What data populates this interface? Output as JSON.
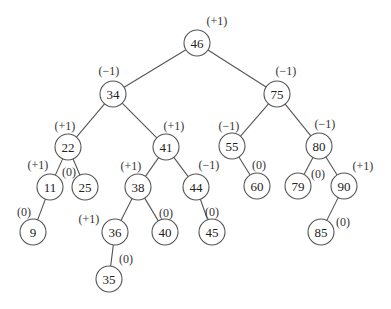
{
  "diagram": {
    "type": "AVL tree with balance factors",
    "node_radius": 13,
    "nodes": [
      {
        "id": "n46",
        "value": "46",
        "balance": "(+1)",
        "x": 197,
        "y": 43,
        "bx": 217,
        "by": 21
      },
      {
        "id": "n34",
        "value": "34",
        "balance": "(−1)",
        "x": 113,
        "y": 94,
        "bx": 109,
        "by": 71
      },
      {
        "id": "n75",
        "value": "75",
        "balance": "(−1)",
        "x": 277,
        "y": 94,
        "bx": 286,
        "by": 71
      },
      {
        "id": "n22",
        "value": "22",
        "balance": "(+1)",
        "x": 68,
        "y": 147,
        "bx": 65,
        "by": 126
      },
      {
        "id": "n41",
        "value": "41",
        "balance": "(+1)",
        "x": 166,
        "y": 147,
        "bx": 174,
        "by": 126
      },
      {
        "id": "n55",
        "value": "55",
        "balance": "(−1)",
        "x": 232,
        "y": 146,
        "bx": 229,
        "by": 126
      },
      {
        "id": "n80",
        "value": "80",
        "balance": "(−1)",
        "x": 319,
        "y": 146,
        "bx": 325,
        "by": 124
      },
      {
        "id": "n11",
        "value": "11",
        "balance": "(+1)",
        "x": 50,
        "y": 187,
        "bx": 38,
        "by": 165
      },
      {
        "id": "n25",
        "value": "25",
        "balance": "(0)",
        "x": 85,
        "y": 187,
        "bx": 69,
        "by": 172
      },
      {
        "id": "n38",
        "value": "38",
        "balance": "(+1)",
        "x": 138,
        "y": 187,
        "bx": 131,
        "by": 166
      },
      {
        "id": "n44",
        "value": "44",
        "balance": "(−1)",
        "x": 196,
        "y": 187,
        "bx": 209,
        "by": 165
      },
      {
        "id": "n60",
        "value": "60",
        "balance": "(0)",
        "x": 257,
        "y": 186,
        "bx": 259,
        "by": 165
      },
      {
        "id": "n79",
        "value": "79",
        "balance": "(0)",
        "x": 298,
        "y": 186,
        "bx": 318,
        "by": 174
      },
      {
        "id": "n90",
        "value": "90",
        "balance": "(+1)",
        "x": 344,
        "y": 186,
        "bx": 363,
        "by": 166
      },
      {
        "id": "n9",
        "value": "9",
        "balance": "(0)",
        "x": 33,
        "y": 232,
        "bx": 24,
        "by": 212
      },
      {
        "id": "n36",
        "value": "36",
        "balance": "(+1)",
        "x": 115,
        "y": 232,
        "bx": 89,
        "by": 219
      },
      {
        "id": "n40",
        "value": "40",
        "balance": "(0)",
        "x": 165,
        "y": 232,
        "bx": 166,
        "by": 213
      },
      {
        "id": "n45",
        "value": "45",
        "balance": "(0)",
        "x": 212,
        "y": 232,
        "bx": 212,
        "by": 212
      },
      {
        "id": "n85",
        "value": "85",
        "balance": "(0)",
        "x": 321,
        "y": 232,
        "bx": 343,
        "by": 222
      },
      {
        "id": "n35",
        "value": "35",
        "balance": "(0)",
        "x": 109,
        "y": 279,
        "bx": 126,
        "by": 259
      }
    ],
    "edges": [
      [
        "n46",
        "n34"
      ],
      [
        "n46",
        "n75"
      ],
      [
        "n34",
        "n22"
      ],
      [
        "n34",
        "n41"
      ],
      [
        "n75",
        "n55"
      ],
      [
        "n75",
        "n80"
      ],
      [
        "n22",
        "n11"
      ],
      [
        "n22",
        "n25"
      ],
      [
        "n41",
        "n38"
      ],
      [
        "n41",
        "n44"
      ],
      [
        "n55",
        "n60"
      ],
      [
        "n80",
        "n79"
      ],
      [
        "n80",
        "n90"
      ],
      [
        "n11",
        "n9"
      ],
      [
        "n38",
        "n36"
      ],
      [
        "n38",
        "n40"
      ],
      [
        "n44",
        "n45"
      ],
      [
        "n90",
        "n85"
      ],
      [
        "n36",
        "n35"
      ]
    ]
  }
}
